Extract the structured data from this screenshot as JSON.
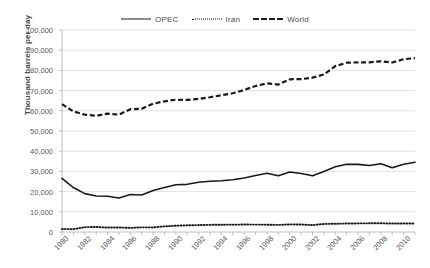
{
  "chart_data": {
    "type": "line",
    "title": "",
    "xlabel": "",
    "ylabel": "Thousand barrels per day",
    "ylim": [
      0,
      100000
    ],
    "ytick_labels": [
      "100,000",
      "90,000",
      "80,000",
      "70,000",
      "60,000",
      "50,000",
      "40,000",
      "30,000",
      "20,000",
      "10,000",
      "0"
    ],
    "ytick_values": [
      100000,
      90000,
      80000,
      70000,
      60000,
      50000,
      40000,
      30000,
      20000,
      10000,
      0
    ],
    "grid": "horizontal",
    "legend_position": "top-center",
    "x": [
      1980,
      1981,
      1982,
      1983,
      1984,
      1985,
      1986,
      1987,
      1988,
      1989,
      1990,
      1991,
      1992,
      1993,
      1994,
      1995,
      1996,
      1997,
      1998,
      1999,
      2000,
      2001,
      2002,
      2003,
      2004,
      2005,
      2006,
      2007,
      2008,
      2009,
      2010,
      2011
    ],
    "xtick_labels": [
      "1980",
      "1982",
      "1984",
      "1986",
      "1988",
      "1990",
      "1992",
      "1994",
      "1996",
      "1998",
      "2000",
      "2002",
      "2004",
      "2006",
      "2008",
      "2010"
    ],
    "xtick_values": [
      1980,
      1982,
      1984,
      1986,
      1988,
      1990,
      1992,
      1994,
      1996,
      1998,
      2000,
      2002,
      2004,
      2006,
      2008,
      2010
    ],
    "series": [
      {
        "name": "OPEC",
        "style": "solid",
        "color": "#1a1a1a",
        "values": [
          26500,
          22000,
          19000,
          17800,
          17700,
          16800,
          18600,
          18300,
          20500,
          22000,
          23400,
          23600,
          24600,
          25100,
          25400,
          25900,
          26700,
          28000,
          29100,
          27800,
          29700,
          29000,
          27800,
          30000,
          32300,
          33500,
          33500,
          32900,
          33800,
          31800,
          33500,
          34500
        ]
      },
      {
        "name": "Iran",
        "style": "dotted",
        "color": "#1a1a1a",
        "values": [
          1480,
          1380,
          2400,
          2500,
          2200,
          2250,
          2040,
          2300,
          2260,
          2810,
          3090,
          3310,
          3430,
          3540,
          3620,
          3640,
          3690,
          3660,
          3630,
          3500,
          3770,
          3720,
          3420,
          3990,
          4090,
          4180,
          4260,
          4300,
          4320,
          4180,
          4240,
          4230
        ]
      },
      {
        "name": "World",
        "style": "dashed",
        "color": "#1a1a1a",
        "values": [
          63300,
          59700,
          58100,
          57500,
          58600,
          58100,
          60800,
          61000,
          63500,
          64700,
          65500,
          65400,
          65900,
          66700,
          67700,
          68700,
          70300,
          72300,
          73600,
          73000,
          75600,
          75700,
          76400,
          78000,
          82100,
          83800,
          84000,
          84000,
          84500,
          83900,
          85500,
          86100
        ]
      }
    ]
  }
}
